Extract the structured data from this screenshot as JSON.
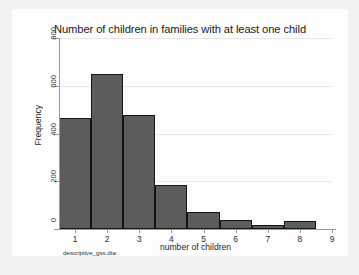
{
  "figure": {
    "background_color": "#f2f2f2",
    "plot_background_color": "#fdfdfd",
    "bar_color": "#5c5c5c",
    "bar_border_color": "#151515",
    "axis_color": "#9a9a9a",
    "grid_color": "#e8e8e8",
    "note": "descriptive_gss.dta"
  },
  "chart_data": {
    "type": "bar",
    "title": "Number of children in families with at least one child",
    "subtitle": "",
    "xlabel": "number of children",
    "ylabel": "Frequency",
    "categories": [
      "1",
      "2",
      "3",
      "4",
      "5",
      "6",
      "7",
      "8"
    ],
    "values": [
      465,
      650,
      477,
      185,
      70,
      37,
      15,
      35
    ],
    "x": [
      1,
      2,
      3,
      4,
      5,
      6,
      7,
      8
    ],
    "bin_width": 1,
    "xlim": [
      0.5,
      9.0
    ],
    "ylim": [
      0,
      800
    ],
    "xticks": [
      1,
      2,
      3,
      4,
      5,
      6,
      7,
      8,
      9
    ],
    "xticklabels": [
      "1",
      "2",
      "3",
      "4",
      "5",
      "6",
      "7",
      "8",
      "9"
    ],
    "yticks": [
      0,
      200,
      400,
      600,
      800
    ],
    "yticklabels": [
      "0",
      "200",
      "400",
      "600",
      "800"
    ],
    "grid": "horizontal",
    "legend": "none",
    "annotations": [
      "descriptive_gss.dta"
    ]
  }
}
